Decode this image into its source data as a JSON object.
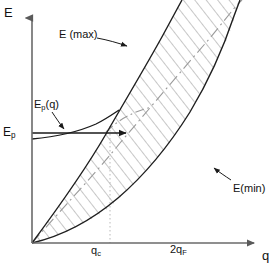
{
  "figure": {
    "kind": "physics-dispersion-diagram",
    "background_color": "#ffffff",
    "line_color": "#1a1a1a",
    "hatch_color": "#8a8a8a",
    "dashdot_color": "#9a9a9a",
    "dotted_color": "#b5b5b5"
  },
  "axes": {
    "y_label": "E",
    "x_label": "q",
    "origin": {
      "x": 32,
      "y": 243
    },
    "x_axis_end": {
      "x": 258,
      "y": 243
    },
    "y_axis_top": {
      "x": 32,
      "y": 14
    }
  },
  "ticks": {
    "x": [
      {
        "label_html": "q<sub>c</sub>",
        "label_text": "q_c",
        "x": 99
      },
      {
        "label_html": "2q<sub>F</sub>",
        "label_text": "2q_F",
        "x": 178
      }
    ],
    "y": [
      {
        "label_html": "E<sub>p</sub>",
        "label_text": "E_p",
        "y": 133
      }
    ]
  },
  "annotations": [
    {
      "name": "E(max)",
      "text": "E (max)",
      "x": 59,
      "y": 29,
      "leader_from": [
        112,
        39
      ],
      "leader_to": [
        132,
        45
      ]
    },
    {
      "name": "E(min)",
      "text": "E(min)",
      "x": 233,
      "y": 183,
      "leader_from": [
        232,
        180
      ],
      "leader_to": [
        215,
        170
      ]
    },
    {
      "name": "E_p(q)",
      "text_html": "E<sub>p</sub>(q)",
      "text": "E_p(q)",
      "x": 34,
      "y": 99,
      "leader_from": [
        56,
        112
      ],
      "leader_to": [
        68,
        126
      ]
    }
  ],
  "curves": {
    "E_max": {
      "label": "E (max)",
      "style": "solid",
      "points": [
        [
          32,
          243
        ],
        [
          60,
          205
        ],
        [
          85,
          168
        ],
        [
          108,
          130
        ],
        [
          128,
          96
        ],
        [
          146,
          64
        ],
        [
          162,
          36
        ],
        [
          175,
          12
        ],
        [
          182,
          0
        ]
      ]
    },
    "E_min": {
      "label": "E(min)",
      "style": "solid",
      "points": [
        [
          32,
          243
        ],
        [
          55,
          238
        ],
        [
          80,
          227
        ],
        [
          105,
          211
        ],
        [
          130,
          190
        ],
        [
          152,
          166
        ],
        [
          172,
          140
        ],
        [
          190,
          112
        ],
        [
          206,
          82
        ],
        [
          220,
          52
        ],
        [
          232,
          22
        ],
        [
          240,
          0
        ]
      ]
    },
    "E_p_of_q": {
      "label": "E_p(q)",
      "style": "solid-with-arrow",
      "points": [
        [
          32,
          139
        ],
        [
          52,
          137
        ],
        [
          72,
          134
        ],
        [
          92,
          128
        ],
        [
          108,
          120
        ],
        [
          118,
          112
        ]
      ],
      "arrow_line": {
        "from": [
          32,
          133
        ],
        "to": [
          130,
          133
        ]
      }
    },
    "dash_dot_diagonal": {
      "style": "dash-dot",
      "points": [
        [
          32,
          243
        ],
        [
          120,
          143
        ],
        [
          160,
          98
        ],
        [
          200,
          52
        ],
        [
          230,
          16
        ],
        [
          242,
          0
        ]
      ]
    },
    "dash_dot_short": {
      "style": "dash-dot",
      "points": [
        [
          108,
          130
        ],
        [
          128,
          115
        ],
        [
          150,
          108
        ]
      ]
    },
    "dotted_vertical_qc": {
      "style": "dotted",
      "from": [
        110,
        128
      ],
      "to": [
        110,
        243
      ]
    }
  },
  "hatching": {
    "description": "Parallel diagonal lines filling the region between E(max) and E(min)",
    "direction": "up-right-to-down-left",
    "spacing_px": 9,
    "color": "#8f8f8f"
  }
}
